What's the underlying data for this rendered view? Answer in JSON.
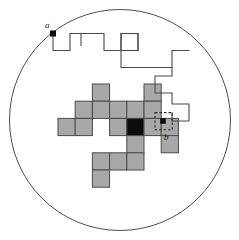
{
  "figure": {
    "background_color": "#ffffff",
    "width": 239,
    "height": 240
  },
  "boundary_circle": {
    "name": "boundary-circle",
    "cx": 120,
    "cy": 120,
    "r": 110.5,
    "stroke": "#3a3a3a",
    "stroke_width": 0.9,
    "fill": "none"
  },
  "grid": {
    "cell_size": 17.2,
    "origin_x": 58.0,
    "origin_y": 84.0,
    "shaded_fill": "#a8a8a8",
    "shaded_stroke": "#4a4a4a",
    "highlight_fill": "#0d0d0d",
    "stroke_width": 1.0,
    "cells": [
      {
        "col": 2,
        "row": 0
      },
      {
        "col": 5,
        "row": 0
      },
      {
        "col": 1,
        "row": 1
      },
      {
        "col": 2,
        "row": 1
      },
      {
        "col": 3,
        "row": 1
      },
      {
        "col": 4,
        "row": 1
      },
      {
        "col": 5,
        "row": 1
      },
      {
        "col": 0,
        "row": 2
      },
      {
        "col": 1,
        "row": 2
      },
      {
        "col": 3,
        "row": 2
      },
      {
        "col": 4,
        "row": 2
      },
      {
        "col": 5,
        "row": 2
      },
      {
        "col": 6,
        "row": 2
      },
      {
        "col": 4,
        "row": 3
      },
      {
        "col": 6,
        "row": 3
      },
      {
        "col": 2,
        "row": 4
      },
      {
        "col": 3,
        "row": 4
      },
      {
        "col": 4,
        "row": 4
      },
      {
        "col": 2,
        "row": 5
      }
    ],
    "highlight_cell": {
      "col": 4,
      "row": 2
    }
  },
  "markers": [
    {
      "name": "point-a-marker",
      "label": "a",
      "x": 53.0,
      "y": 33.5,
      "size": 6.0,
      "fill": "#0d0d0d",
      "label_x": 45.0,
      "label_y": 28.0
    },
    {
      "name": "point-b-marker",
      "label": "b",
      "x": 163.0,
      "y": 121.0,
      "size": 5.6,
      "fill": "#0d0d0d",
      "label_x": 164.0,
      "label_y": 140.0
    }
  ],
  "dashed_box": {
    "name": "dashed-selection-box",
    "x": 155.0,
    "y": 112.6,
    "width": 17.2,
    "height": 17.2,
    "stroke": "#2a2a2a",
    "stroke_width": 1.1,
    "dash": "2.5,2"
  },
  "walk_path": {
    "name": "lattice-walk-path",
    "stroke": "#4a4a4a",
    "stroke_width": 1.1,
    "fill": "none",
    "points": "53,33.5 53,50.5 70,50.5 70,33.5 104,33.5 104,50.5 121,50.5 121,33.5 138,33.5 138,50.5 121,50.5 121,67.5 172,67.5 172,50.5 189,50.5",
    "segments": [
      {
        "from": [
          53,
          33.5
        ],
        "to": [
          53,
          50.5
        ]
      },
      {
        "from": [
          53,
          50.5
        ],
        "to": [
          70,
          50.5
        ]
      },
      {
        "from": [
          70,
          50.5
        ],
        "to": [
          70,
          33.5
        ]
      },
      {
        "from": [
          70,
          33.5
        ],
        "to": [
          104,
          33.5
        ]
      },
      {
        "from": [
          104,
          33.5
        ],
        "to": [
          104,
          50.5
        ]
      },
      {
        "from": [
          104,
          50.5
        ],
        "to": [
          121,
          50.5
        ]
      },
      {
        "from": [
          121,
          50.5
        ],
        "to": [
          121,
          33.5
        ]
      },
      {
        "from": [
          121,
          33.5
        ],
        "to": [
          138,
          33.5
        ]
      },
      {
        "from": [
          138,
          33.5
        ],
        "to": [
          138,
          50.5
        ]
      },
      {
        "from": [
          121,
          50.5
        ],
        "to": [
          121,
          67.5
        ]
      },
      {
        "from": [
          121,
          67.5
        ],
        "to": [
          172,
          67.5
        ]
      },
      {
        "from": [
          172,
          67.5
        ],
        "to": [
          172,
          50.5
        ]
      },
      {
        "from": [
          172,
          50.5
        ],
        "to": [
          189,
          50.5
        ]
      }
    ],
    "tick_mark": {
      "x": 81,
      "y_top": 33.5,
      "y_bottom": 46.0
    }
  },
  "walk_path_lower": {
    "name": "lattice-walk-path-lower",
    "stroke": "#4a4a4a",
    "stroke_width": 1.1,
    "fill": "none",
    "points": "172,67.5 172,76 155,76 155,93 172,93 172,104 189,104 189,121 172,121 172,112.6"
  },
  "top_square": {
    "name": "open-square-node",
    "x": 121.0,
    "y": 33.5,
    "width": 17.0,
    "height": 17.0,
    "stroke": "#4a4a4a",
    "stroke_width": 1.1,
    "fill": "none"
  }
}
